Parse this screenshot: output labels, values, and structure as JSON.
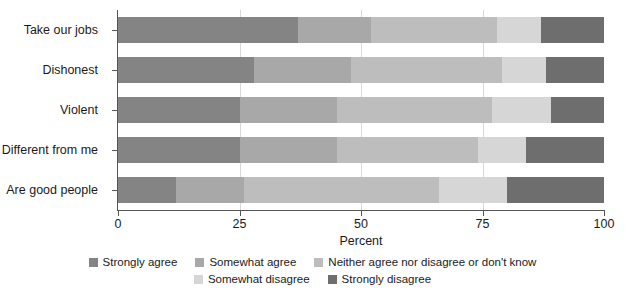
{
  "chart_data": {
    "type": "bar",
    "orientation": "horizontal",
    "stacked": true,
    "stack_mode": "percent",
    "title": "",
    "subtitle": "",
    "xlabel": "Percent",
    "ylabel": "",
    "xlim": [
      0,
      100
    ],
    "xticks": [
      0,
      25,
      50,
      75,
      100
    ],
    "xtick_labels": [
      "0",
      "25",
      "50",
      "75",
      "100"
    ],
    "grid": true,
    "legend_position": "bottom",
    "categories": [
      "Take our jobs",
      "Dishonest",
      "Violent",
      "Different from me",
      "Are good people"
    ],
    "series": [
      {
        "name": "Strongly agree",
        "color": "#848484",
        "values": [
          37,
          28,
          25,
          25,
          12
        ]
      },
      {
        "name": "Somewhat agree",
        "color": "#a8a8a8",
        "values": [
          15,
          20,
          20,
          20,
          14
        ]
      },
      {
        "name": "Neither agree nor disagree or don't know",
        "color": "#bdbdbd",
        "values": [
          26,
          31,
          32,
          29,
          40
        ]
      },
      {
        "name": "Somewhat disagree",
        "color": "#d6d6d6",
        "values": [
          9,
          9,
          12,
          10,
          14
        ]
      },
      {
        "name": "Strongly disagree",
        "color": "#6e6e6e",
        "values": [
          13,
          12,
          11,
          16,
          20
        ]
      }
    ]
  },
  "axis": {
    "x_title": "Percent"
  },
  "legend": {
    "items": [
      {
        "label": "Strongly agree",
        "color": "#848484"
      },
      {
        "label": "Somewhat agree",
        "color": "#a8a8a8"
      },
      {
        "label": "Neither agree nor disagree or don't know",
        "color": "#bdbdbd"
      },
      {
        "label": "Somewhat disagree",
        "color": "#d6d6d6"
      },
      {
        "label": "Strongly disagree",
        "color": "#6e6e6e"
      }
    ],
    "row_breaks": [
      3,
      5
    ]
  }
}
